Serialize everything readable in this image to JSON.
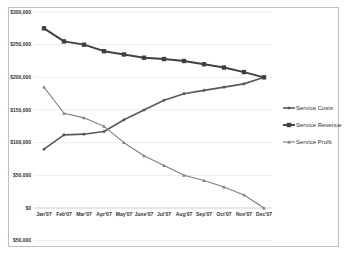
{
  "chart_data": {
    "type": "line",
    "title": "",
    "xlabel": "",
    "ylabel": "",
    "ylim": [
      -50000,
      300000
    ],
    "grid": true,
    "legend_position": "right",
    "y_tick_labels": [
      "$300,000",
      "$250,000",
      "$200,000",
      "$150,000",
      "$100,000",
      "$50,000",
      "$0",
      "$50,000"
    ],
    "y_tick_values": [
      300000,
      250000,
      200000,
      150000,
      100000,
      50000,
      0,
      -50000
    ],
    "categories": [
      "Jan'07",
      "Feb'07",
      "Mar'07",
      "Apr'07",
      "May'07",
      "June'07",
      "Jul'07",
      "Aug'07",
      "Sep'07",
      "Oct'07",
      "Nov'07",
      "Dec'07"
    ],
    "series": [
      {
        "name": "Service Costs",
        "marker": "diamond",
        "color": "#595959",
        "values": [
          90000,
          112000,
          113000,
          117000,
          135000,
          150000,
          165000,
          175000,
          180000,
          185000,
          190000,
          200000
        ]
      },
      {
        "name": "Service Revenue",
        "marker": "square",
        "color": "#404040",
        "values": [
          275000,
          255000,
          250000,
          240000,
          235000,
          230000,
          228000,
          225000,
          220000,
          215000,
          208000,
          200000
        ]
      },
      {
        "name": "Service Profit",
        "marker": "triangle",
        "color": "#7f7f7f",
        "values": [
          185000,
          145000,
          138000,
          125000,
          100000,
          80000,
          65000,
          50000,
          42000,
          32000,
          20000,
          0
        ]
      }
    ]
  }
}
